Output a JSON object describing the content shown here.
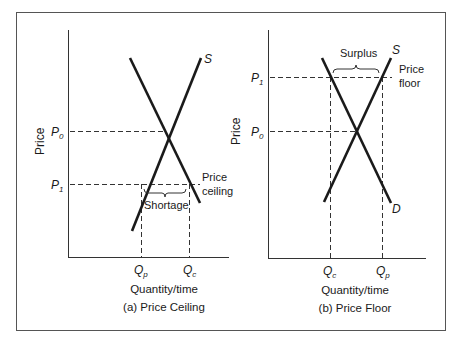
{
  "figure": {
    "panels": [
      {
        "id": "a",
        "caption": "(a) Price Ceiling",
        "ylabel": "Price",
        "xlabel": "Quantity/time",
        "curves": {
          "supply": "S",
          "demand": ""
        },
        "price_levels": {
          "p0": "P",
          "p0_sub": "0",
          "p1": "P",
          "p1_sub": "1"
        },
        "quantities": {
          "left": "Q",
          "left_sub": "p",
          "right": "Q",
          "right_sub": "c"
        },
        "policy_label_line1": "Price",
        "policy_label_line2": "ceiling",
        "gap_label": "Shortage"
      },
      {
        "id": "b",
        "caption": "(b) Price Floor",
        "ylabel": "Price",
        "xlabel": "Quantity/time",
        "curves": {
          "supply": "S",
          "demand": "D"
        },
        "price_levels": {
          "p0": "P",
          "p0_sub": "0",
          "p1": "P",
          "p1_sub": "1"
        },
        "quantities": {
          "left": "Q",
          "left_sub": "c",
          "right": "Q",
          "right_sub": "p"
        },
        "policy_label_line1": "Price",
        "policy_label_line2": "floor",
        "gap_label": "Surplus"
      }
    ],
    "colors": {
      "line": "#1a1a1a",
      "frame": "#555555",
      "dash": "#333333"
    }
  }
}
